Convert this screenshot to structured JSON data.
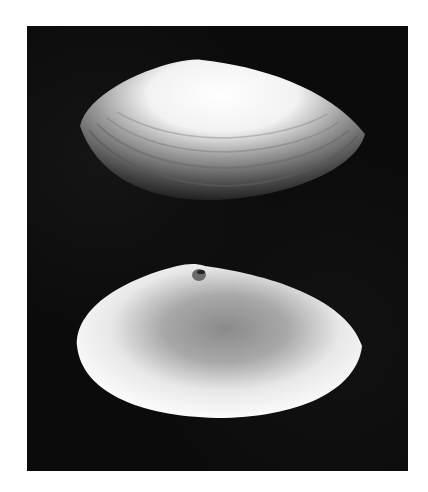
{
  "figure": {
    "background_color": "#0b0b0b",
    "page_color": "#ffffff",
    "specimens": [
      {
        "view": "exterior",
        "position": "top"
      },
      {
        "view": "interior",
        "position": "bottom"
      }
    ]
  }
}
